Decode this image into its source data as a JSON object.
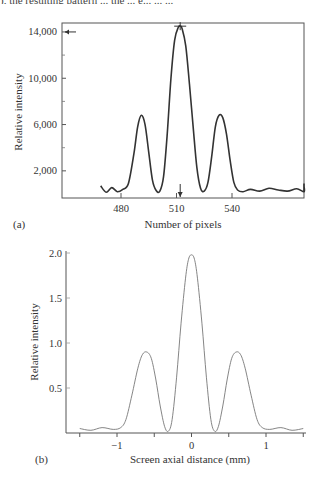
{
  "header_fragment": "), the resulting pattern ... the ... e... ... ...",
  "chart_data": [
    {
      "panel": "(a)",
      "type": "line",
      "title": "",
      "xlabel": "Number of pixels",
      "ylabel": "Relative intensity",
      "xticks": [
        480,
        510,
        540
      ],
      "yticks": [
        "2,000",
        "6,000",
        "10,000",
        "14,000"
      ],
      "ytick_values": [
        2000,
        6000,
        10000,
        14000
      ],
      "xlim": [
        469,
        600
      ],
      "ylim": [
        0,
        15200
      ],
      "grid": false,
      "frame": "box",
      "markers": {
        "peak_cross": {
          "x": 512,
          "y": 14500
        },
        "left_arrow_at_y": 14000,
        "down_arrow_at_x": 512
      },
      "x": [
        469,
        472,
        475,
        478,
        481,
        484,
        487,
        489,
        491,
        493,
        495,
        497,
        499,
        501,
        503,
        505,
        507,
        509,
        511,
        512,
        513,
        515,
        517,
        519,
        521,
        523,
        525,
        527,
        529,
        531,
        533,
        535,
        537,
        539,
        541,
        543,
        546,
        550,
        555,
        560,
        565,
        570,
        575,
        580,
        585,
        590,
        595,
        600
      ],
      "values": [
        700,
        150,
        550,
        200,
        400,
        900,
        3500,
        5800,
        6800,
        6000,
        3600,
        1200,
        300,
        250,
        1500,
        5200,
        10000,
        13300,
        14400,
        14500,
        14300,
        12800,
        9500,
        5800,
        2300,
        500,
        250,
        1000,
        3200,
        5800,
        6800,
        6600,
        5200,
        2900,
        1000,
        350,
        200,
        400,
        250,
        500,
        350,
        250,
        450,
        200,
        650,
        300,
        400,
        900
      ]
    },
    {
      "panel": "(b)",
      "type": "line",
      "title": "",
      "xlabel": "Screen axial distance (mm)",
      "ylabel": "Relative intensity",
      "xticks": [
        "-1",
        "0",
        "1"
      ],
      "xtick_values": [
        -1,
        0,
        1
      ],
      "minor_xtick_values": [
        -1.5,
        -0.5,
        0.5,
        1.5
      ],
      "yticks": [
        "0.5",
        "1.0",
        "1.5",
        "2.0"
      ],
      "ytick_values": [
        0.5,
        1.0,
        1.5,
        2.0
      ],
      "xlim": [
        -1.6,
        1.55
      ],
      "ylim": [
        0,
        2.05
      ],
      "grid": false,
      "frame": "left-bottom",
      "x": [
        -1.5,
        -1.35,
        -1.2,
        -1.05,
        -0.95,
        -0.88,
        -0.8,
        -0.72,
        -0.66,
        -0.6,
        -0.54,
        -0.48,
        -0.42,
        -0.36,
        -0.31,
        -0.26,
        -0.2,
        -0.14,
        -0.08,
        -0.04,
        0.0,
        0.04,
        0.08,
        0.14,
        0.2,
        0.26,
        0.31,
        0.36,
        0.42,
        0.48,
        0.54,
        0.6,
        0.66,
        0.72,
        0.8,
        0.88,
        0.95,
        1.05,
        1.2,
        1.35,
        1.5
      ],
      "values": [
        0.05,
        0.03,
        0.06,
        0.04,
        0.06,
        0.15,
        0.42,
        0.72,
        0.87,
        0.9,
        0.83,
        0.6,
        0.3,
        0.07,
        0.02,
        0.15,
        0.62,
        1.22,
        1.72,
        1.93,
        1.98,
        1.93,
        1.72,
        1.22,
        0.62,
        0.15,
        0.02,
        0.07,
        0.3,
        0.6,
        0.83,
        0.9,
        0.87,
        0.72,
        0.42,
        0.15,
        0.06,
        0.04,
        0.06,
        0.03,
        0.05
      ]
    }
  ]
}
